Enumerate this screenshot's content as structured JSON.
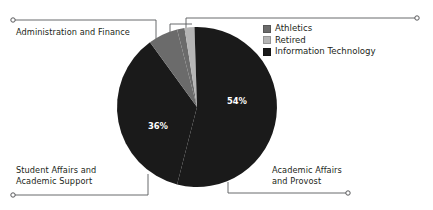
{
  "background_color": "#ffffff",
  "text_color": "#231f20",
  "leader_line_color": "#58595b",
  "callouts": [
    {
      "id": "admin-finance",
      "label": "Administration and Finance"
    },
    {
      "id": "student-affairs",
      "label": "Student Affairs and\nAcademic Support"
    },
    {
      "id": "academic-affairs",
      "label": "Academic Affairs\nand Provost"
    }
  ],
  "legend": {
    "position": "top-right",
    "items": [
      {
        "label": "Athletics",
        "color": "#6b6b6b"
      },
      {
        "label": "Retired",
        "color": "#b5b5b5"
      },
      {
        "label": "Information Technology",
        "color": "#1a1a1a"
      }
    ]
  },
  "chart_data": {
    "type": "pie",
    "title": "",
    "center": {
      "x": 197,
      "y": 107
    },
    "radius": 80,
    "start_angle_deg": -90,
    "grid": false,
    "legend_position": "top-right",
    "labels": [
      "Academic Affairs and Provost",
      "Student Affairs and Academic Support",
      "Administration and Finance",
      "Athletics",
      "Retired",
      "Information Technology"
    ],
    "values": [
      54,
      36,
      6,
      1.5,
      2,
      0.5
    ],
    "value_labels": [
      "54%",
      "36%",
      "",
      "",
      "",
      ""
    ],
    "colors": [
      "#1a1a1a",
      "#1a1a1a",
      "#6b6b6b",
      "#6b6b6b",
      "#b5b5b5",
      "#1a1a1a"
    ],
    "displayed_percentages": {
      "academic_affairs_and_provost": "54%",
      "student_affairs_and_academic_support": "36%"
    }
  }
}
